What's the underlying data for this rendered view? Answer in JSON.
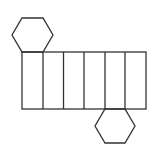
{
  "diagram": {
    "type": "hexagonal-prism-net",
    "stroke_color": "#333333",
    "background": "#ffffff",
    "top_hexagon": "22,18 43,18 53,35 43,52 22,52 12,35",
    "bottom_hexagon": "105,109 125,109 135,126 125,143 105,143 95,126",
    "rectangle": {
      "x": 22,
      "y": 52,
      "width": 124,
      "height": 57
    },
    "face_dividers": [
      43,
      63.5,
      84,
      105,
      125
    ],
    "face_count": 6
  }
}
